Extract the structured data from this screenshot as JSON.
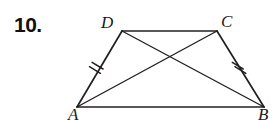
{
  "page": {
    "background_color": "#ffffff",
    "width": 276,
    "height": 120
  },
  "exercise": {
    "number_label": "10."
  },
  "figure": {
    "type": "isosceles-trapezoid-with-diagonals",
    "stroke_color": "#231f20",
    "stroke_width": 1.6,
    "vertices": [
      {
        "name": "A",
        "label": "A",
        "x": 77,
        "y": 107,
        "label_x": 70,
        "label_y": 119
      },
      {
        "name": "B",
        "label": "B",
        "x": 264,
        "y": 107,
        "label_x": 259,
        "label_y": 119
      },
      {
        "name": "C",
        "label": "C",
        "x": 217,
        "y": 31,
        "label_x": 221,
        "label_y": 27
      },
      {
        "name": "D",
        "label": "D",
        "x": 122,
        "y": 31,
        "label_x": 101,
        "label_y": 28
      }
    ],
    "sides": [
      {
        "name": "side-AB",
        "from": "A",
        "to": "B",
        "ticks": 0
      },
      {
        "name": "side-BC",
        "from": "B",
        "to": "C",
        "ticks": 2
      },
      {
        "name": "side-CD",
        "from": "C",
        "to": "D",
        "ticks": 0
      },
      {
        "name": "side-DA",
        "from": "D",
        "to": "A",
        "ticks": 2
      }
    ],
    "diagonals": [
      {
        "name": "diagonal-AC",
        "from": "A",
        "to": "C"
      },
      {
        "name": "diagonal-BD",
        "from": "B",
        "to": "D"
      }
    ],
    "tick_marks": {
      "count_per_leg": 2,
      "length": 13,
      "spacing": 5,
      "stroke_width": 1.4
    }
  }
}
